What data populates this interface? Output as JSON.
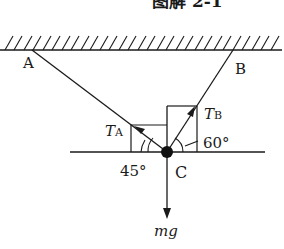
{
  "figure": {
    "caption_partial": "图解 2-1"
  },
  "points": {
    "A": "A",
    "B": "B",
    "C": "C"
  },
  "forces": {
    "tension_a": {
      "symbol": "T",
      "subscript": "A"
    },
    "tension_b": {
      "symbol": "T",
      "subscript": "B"
    },
    "gravity": "mg"
  },
  "angles": {
    "angle_a": "45°",
    "angle_b": "60°"
  },
  "colors": {
    "stroke": "#1a1a1a",
    "background": "#ffffff"
  }
}
